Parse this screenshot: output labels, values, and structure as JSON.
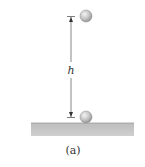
{
  "figure": {
    "height_label": "h",
    "caption": "(a)"
  },
  "colors": {
    "ball_fill": "#c8c8c8",
    "ball_stroke": "#8a8a8a",
    "ground": "#c4c4c4",
    "dimension_line": "#444444"
  }
}
